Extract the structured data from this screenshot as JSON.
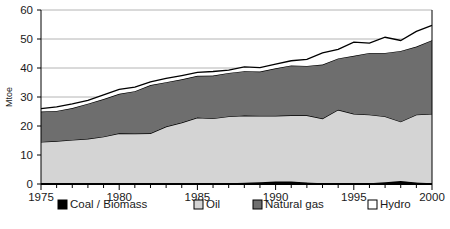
{
  "chart_data": {
    "type": "area",
    "stacked": true,
    "title": "",
    "xlabel": "",
    "ylabel": "Mtoe",
    "xlim": [
      1975,
      2000
    ],
    "ylim": [
      0,
      60
    ],
    "y_ticks": [
      0,
      10,
      20,
      30,
      40,
      50,
      60
    ],
    "x_ticks": [
      1975,
      1980,
      1985,
      1990,
      1995,
      2000
    ],
    "x_tick_labels": [
      "1975",
      "1980",
      "1985",
      "1990",
      "1995",
      "2000"
    ],
    "y_tick_labels": [
      "0",
      "10",
      "20",
      "30",
      "40",
      "50",
      "60"
    ],
    "grid": "horizontal",
    "legend_position": "bottom",
    "x": [
      1975,
      1976,
      1977,
      1978,
      1979,
      1980,
      1981,
      1982,
      1983,
      1984,
      1985,
      1986,
      1987,
      1988,
      1989,
      1990,
      1991,
      1992,
      1993,
      1994,
      1995,
      1996,
      1997,
      1998,
      1999,
      2000
    ],
    "series": [
      {
        "name": "Coal / Biomass",
        "color": "#000000",
        "values": [
          0.2,
          0.2,
          0.2,
          0.2,
          0.2,
          0.2,
          0.2,
          0.2,
          0.2,
          0.2,
          0.2,
          0.2,
          0.3,
          0.4,
          0.6,
          0.9,
          0.9,
          0.5,
          0.3,
          0.3,
          0.3,
          0.3,
          0.6,
          1.0,
          0.5,
          0.3
        ]
      },
      {
        "name": "Oil",
        "color": "#d4d4d4",
        "values": [
          14.3,
          14.6,
          15.0,
          15.4,
          16.1,
          17.3,
          17.2,
          17.3,
          19.6,
          21.0,
          22.7,
          22.4,
          23.0,
          23.2,
          22.9,
          22.6,
          22.8,
          23.2,
          22.3,
          25.3,
          23.9,
          23.6,
          22.7,
          20.5,
          23.4,
          23.9
        ]
      },
      {
        "name": "Natural gas",
        "color": "#6e6e6e",
        "values": [
          10.5,
          10.4,
          11.0,
          12.1,
          13.0,
          13.6,
          14.6,
          16.6,
          15.3,
          14.9,
          14.4,
          14.8,
          15.0,
          15.3,
          15.3,
          16.4,
          17.2,
          17.0,
          18.6,
          17.7,
          20.0,
          21.3,
          21.9,
          24.4,
          23.5,
          25.4
        ]
      },
      {
        "name": "Hydro",
        "color": "#ffffff",
        "values": [
          1.0,
          1.4,
          1.4,
          1.1,
          1.4,
          1.5,
          1.4,
          1.1,
          1.3,
          1.3,
          1.2,
          1.4,
          1.0,
          1.5,
          1.3,
          1.4,
          1.6,
          2.3,
          4.0,
          3.1,
          4.7,
          3.4,
          5.4,
          3.6,
          5.2,
          5.1
        ]
      }
    ],
    "totals": [
      26.0,
      26.6,
      27.6,
      28.8,
      30.7,
      32.6,
      33.4,
      35.2,
      36.4,
      37.4,
      38.5,
      38.8,
      39.3,
      40.4,
      40.1,
      41.3,
      42.5,
      43.0,
      45.2,
      46.4,
      48.9,
      48.6,
      50.6,
      49.5,
      52.6,
      54.7
    ]
  },
  "legend": {
    "items": [
      {
        "label": "Coal / Biomass",
        "swatch": "#000000"
      },
      {
        "label": "Oil",
        "swatch": "#d4d4d4"
      },
      {
        "label": "Natural gas",
        "swatch": "#6e6e6e"
      },
      {
        "label": "Hydro",
        "swatch": "#ffffff"
      }
    ]
  }
}
